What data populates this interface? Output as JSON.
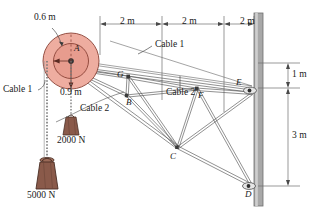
{
  "figure": {
    "type": "statics-free-body-diagram"
  },
  "dimensions": {
    "pulley_outer_radius": "0.9 m",
    "pulley_inner_radius": "0.6 m",
    "span_1": "2 m",
    "span_2": "2 m",
    "span_3": "2 m",
    "wall_upper": "1 m",
    "wall_lower": "3 m"
  },
  "cables": {
    "cable_1_left": "Cable 1",
    "cable_1_top": "Cable 1",
    "cable_2_left": "Cable 2",
    "cable_2_mid": "Cable 2"
  },
  "loads": {
    "load_small": "2000 N",
    "load_large": "5000 N"
  },
  "joints": {
    "A": "A",
    "B": "B",
    "C": "C",
    "D": "D",
    "E": "E",
    "F": "F",
    "G": "G"
  },
  "colors": {
    "pulley_fill": "#eeada0",
    "pulley_inner_fill": "#e79c8e",
    "pulley_stroke": "#7a3b33",
    "weight_fill": "#8a5a4a",
    "weight_stroke": "#4a2e24",
    "wall_fill": "#a8a8a8",
    "member_stroke": "#555555",
    "dim_stroke": "#888888",
    "text": "#1a1a1a"
  }
}
